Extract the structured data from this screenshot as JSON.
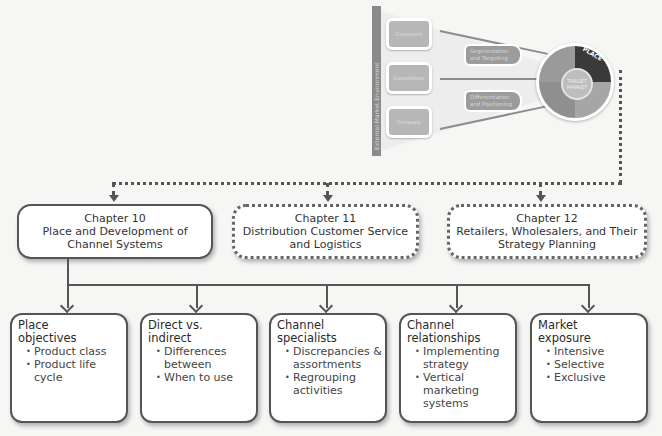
{
  "thumbnail": {
    "environment_label": "External Market Environment",
    "left_boxes": [
      "Customers",
      "Competitors",
      "Company"
    ],
    "middle_boxes": [
      "Segmentation and Targeting",
      "Differentiation and Positioning"
    ],
    "ring": {
      "center": "TARGET MARKET",
      "segments": [
        "PRODUCT",
        "PLACE",
        "PROMOTION",
        "PRICE"
      ],
      "highlighted": "PLACE"
    }
  },
  "chapters": [
    {
      "number": "Chapter 10",
      "title": "Place and Development of Channel Systems",
      "style": "solid"
    },
    {
      "number": "Chapter 11",
      "title": "Distribution Customer Service and Logistics",
      "style": "dotted"
    },
    {
      "number": "Chapter 12",
      "title": "Retailers, Wholesalers, and Their Strategy Planning",
      "style": "dotted"
    }
  ],
  "topics": [
    {
      "title": "Place objectives",
      "bullets": [
        "Product class",
        "Product life cycle"
      ]
    },
    {
      "title": "Direct vs. indirect",
      "bullets": [
        "Differences between",
        "When to use"
      ]
    },
    {
      "title": "Channel specialists",
      "bullets": [
        "Discrepancies & assortments",
        "Regrouping activities"
      ]
    },
    {
      "title": "Channel relationships",
      "bullets": [
        "Implementing strategy",
        "Vertical marketing systems"
      ]
    },
    {
      "title": "Market exposure",
      "bullets": [
        "Intensive",
        "Selective",
        "Exclusive"
      ]
    }
  ],
  "colors": {
    "line": "#555555",
    "box_fill": "#ffffff",
    "background": "#f6f6f4",
    "place_segment": "#3a3a3a"
  }
}
